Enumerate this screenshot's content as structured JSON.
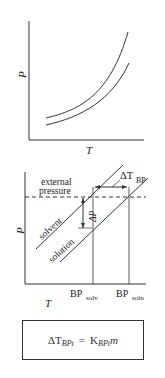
{
  "diagram_top": {
    "y_axis_label": "P",
    "x_axis_label": "T",
    "curves": [
      "upper vapor pressure curve",
      "lower vapor pressure curve"
    ]
  },
  "diagram_bottom": {
    "y_axis_label": "P",
    "x_axis_label": "T",
    "external_pressure_label_line1": "external",
    "external_pressure_label_line2": "pressure",
    "solvent_label": "solvent",
    "solution_label": "solution",
    "delta_p_label": "ΔP",
    "delta_t_label": "ΔT",
    "delta_t_sub": "BP",
    "bp_solv_label": "BP",
    "bp_solv_sub": "solv",
    "bp_soln_label": "BP",
    "bp_soln_sub": "soln"
  },
  "equation": {
    "lhs": "ΔT",
    "lhs_sub": "BPt",
    "equals": "=",
    "rhs": "K",
    "rhs_sub": "BPt",
    "rhs_var": "m"
  },
  "colors": {
    "line": "#333333",
    "background": "#ffffff"
  }
}
